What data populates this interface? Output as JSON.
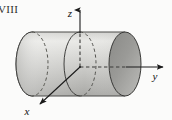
{
  "figure": {
    "plate_label": "VIII",
    "caption": "",
    "background_color": "#fbfbfa",
    "axes": {
      "origin": {
        "x": 80,
        "y": 67
      },
      "z": {
        "label": "z",
        "label_x": 73,
        "label_y": 14,
        "direction": "up",
        "tip_x": 80,
        "tip_y": 8,
        "visible_solid_from_y": 8,
        "hidden_dashed_from_y": 33
      },
      "y": {
        "label": "y",
        "label_x": 152,
        "label_y": 77,
        "direction": "right",
        "tip_x": 166,
        "tip_y": 67,
        "hidden_dashed_to_x": 137
      },
      "x": {
        "label": "x",
        "label_x": 29,
        "label_y": 113,
        "direction": "down-left",
        "tip_x": 37,
        "tip_y": 107
      }
    },
    "cylinder": {
      "axis": "y",
      "left_center": {
        "x": 32,
        "y": 64
      },
      "right_center": {
        "x": 125,
        "y": 64
      },
      "radius_x": 16,
      "radius_y": 32,
      "top_y": 32,
      "bottom_y": 96,
      "body_fill_light": "#e8e8e6",
      "body_fill_mid": "#c9c9c6",
      "body_fill_dark": "#a9a9a6",
      "cap_fill": "#8f8f8c",
      "outline_color": "#4a4a48",
      "back_edge_style": "dashed",
      "front_cross_section": {
        "center_x": 80,
        "center_y": 64,
        "style": "dashed-back-solid-front"
      }
    },
    "stroke_color": "#1a1a1a",
    "stroke_width": 1.1
  }
}
